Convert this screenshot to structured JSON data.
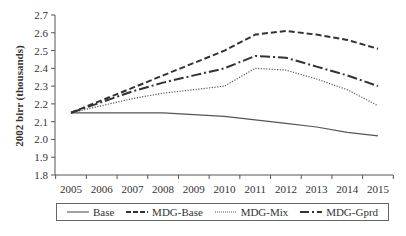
{
  "chart_data": {
    "type": "line",
    "title": "",
    "xlabel": "",
    "ylabel": "2002 birr (thousands)",
    "ylim": [
      1.8,
      2.7
    ],
    "yticks": [
      "1.8",
      "1.9",
      "2.0",
      "2.1",
      "2.2",
      "2.3",
      "2.4",
      "2.5",
      "2.6",
      "2.7"
    ],
    "x": [
      "2005",
      "2006",
      "2007",
      "2008",
      "2009",
      "2010",
      "2011",
      "2012",
      "2013",
      "2014",
      "2015"
    ],
    "grid": false,
    "legend_position": "bottom",
    "series": [
      {
        "name": "Base",
        "style": "solid",
        "values": [
          2.15,
          2.15,
          2.15,
          2.15,
          2.14,
          2.13,
          2.11,
          2.09,
          2.07,
          2.04,
          2.02
        ]
      },
      {
        "name": "MDG-Base",
        "style": "dashed",
        "values": [
          2.15,
          2.22,
          2.29,
          2.36,
          2.43,
          2.5,
          2.59,
          2.61,
          2.59,
          2.56,
          2.51
        ]
      },
      {
        "name": "MDG-Mix",
        "style": "dotted",
        "values": [
          2.15,
          2.19,
          2.23,
          2.26,
          2.28,
          2.3,
          2.4,
          2.39,
          2.34,
          2.28,
          2.19
        ]
      },
      {
        "name": "MDG-Gprd",
        "style": "dash-dot",
        "values": [
          2.15,
          2.21,
          2.27,
          2.32,
          2.36,
          2.4,
          2.47,
          2.46,
          2.41,
          2.36,
          2.3
        ]
      }
    ]
  },
  "legend": {
    "items": [
      {
        "label": "Base"
      },
      {
        "label": "MDG-Base"
      },
      {
        "label": "MDG-Mix"
      },
      {
        "label": "MDG-Gprd"
      }
    ]
  }
}
